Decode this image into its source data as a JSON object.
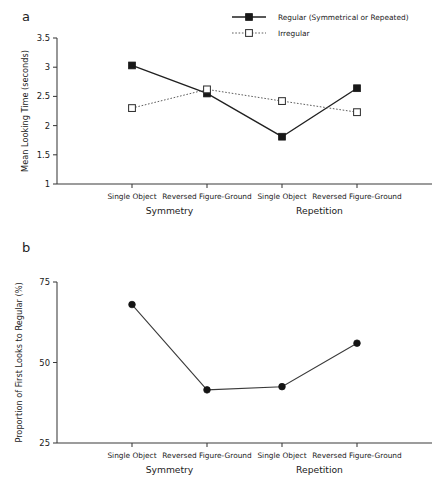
{
  "figure": {
    "panel_a_letter": "a",
    "panel_b_letter": "b"
  },
  "chart_data": [
    {
      "panel": "a",
      "type": "line",
      "title": "",
      "xlabel": "",
      "ylabel": "Mean Looking Time (seconds)",
      "ylim": [
        1,
        3.5
      ],
      "yticks": [
        1,
        1.5,
        2,
        2.5,
        3,
        3.5
      ],
      "ytick_labels": [
        "1",
        "1.5",
        "2",
        "2.5",
        "3",
        "3.5"
      ],
      "grid": false,
      "legend_position": "top-right",
      "categories": [
        "Single Object",
        "Reversed Figure-Ground",
        "Single Object",
        "Reversed Figure-Ground"
      ],
      "group_labels": [
        "Symmetry",
        "Repetition"
      ],
      "series": [
        {
          "name": "Regular (Symmetrical or Repeated)",
          "marker": "filled-square",
          "line": "solid",
          "values": [
            3.03,
            2.55,
            1.81,
            2.64
          ]
        },
        {
          "name": "Irregular",
          "marker": "open-square",
          "line": "dotted",
          "values": [
            2.3,
            2.62,
            2.42,
            2.23
          ]
        }
      ]
    },
    {
      "panel": "b",
      "type": "line",
      "title": "",
      "xlabel": "",
      "ylabel": "Proportion of First Looks to Regular (%)",
      "ylim": [
        25,
        75
      ],
      "yticks": [
        25,
        50,
        75
      ],
      "ytick_labels": [
        "25",
        "50",
        "75"
      ],
      "grid": false,
      "legend_position": "none",
      "categories": [
        "Single Object",
        "Reversed Figure-Ground",
        "Single Object",
        "Reversed Figure-Ground"
      ],
      "group_labels": [
        "Symmetry",
        "Repetition"
      ],
      "series": [
        {
          "name": "Proportion of First Looks to Regular",
          "marker": "filled-circle",
          "line": "solid",
          "values": [
            68,
            41.5,
            42.5,
            56
          ]
        }
      ]
    }
  ]
}
